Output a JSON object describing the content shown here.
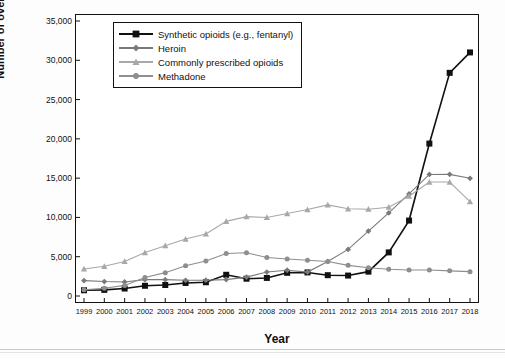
{
  "chart_data": {
    "type": "line",
    "title": "",
    "xlabel": "Year",
    "ylabel": "Number of overdose deaths",
    "categories": [
      1999,
      2000,
      2001,
      2002,
      2003,
      2004,
      2005,
      2006,
      2007,
      2008,
      2009,
      2010,
      2011,
      2012,
      2013,
      2014,
      2015,
      2016,
      2017,
      2018
    ],
    "xlim": [
      1999,
      2018
    ],
    "ylim": [
      0,
      35000
    ],
    "yticks": [
      0,
      5000,
      10000,
      15000,
      20000,
      25000,
      30000,
      35000
    ],
    "ytick_labels": [
      "0",
      "5,000",
      "10,000",
      "15,000",
      "20,000",
      "25,000",
      "30,000",
      "35,000"
    ],
    "xtick_labels": [
      "1999",
      "2000",
      "2001",
      "2002",
      "2003",
      "2004",
      "2005",
      "2006",
      "2007",
      "2008",
      "2009",
      "2010",
      "2011",
      "2012",
      "2013",
      "2014",
      "2015",
      "2016",
      "2017",
      "2018"
    ],
    "grid": false,
    "legend_position": "top-left",
    "series": [
      {
        "name": "Synthetic opioids (e.g., fentanyl)",
        "color": "#111111",
        "marker": "square",
        "values": [
          730,
          780,
          950,
          1300,
          1400,
          1660,
          1750,
          2700,
          2200,
          2300,
          2950,
          3000,
          2650,
          2600,
          3100,
          5550,
          9600,
          19400,
          28400,
          31000
        ]
      },
      {
        "name": "Heroin",
        "color": "#7a7a7a",
        "marker": "diamond",
        "values": [
          1960,
          1840,
          1780,
          2080,
          2080,
          2000,
          2010,
          2090,
          2400,
          3050,
          3280,
          3040,
          4400,
          5930,
          8260,
          10570,
          12990,
          15470,
          15480,
          14980
        ]
      },
      {
        "name": "Commonly prescribed opioids",
        "color": "#a8a8a8",
        "marker": "triangle",
        "values": [
          3440,
          3780,
          4400,
          5530,
          6400,
          7250,
          7900,
          9500,
          10100,
          10000,
          10500,
          11000,
          11600,
          11100,
          11050,
          11300,
          12700,
          14500,
          14500,
          12000
        ]
      },
      {
        "name": "Methadone",
        "color": "#8e8e8e",
        "marker": "circle",
        "values": [
          780,
          980,
          1350,
          2360,
          2970,
          3850,
          4460,
          5400,
          5500,
          4900,
          4700,
          4550,
          4400,
          3900,
          3600,
          3400,
          3300,
          3300,
          3200,
          3100
        ]
      }
    ]
  },
  "legend": {
    "items": [
      {
        "label": "Synthetic opioids (e.g., fentanyl)"
      },
      {
        "label": "Heroin"
      },
      {
        "label": "Commonly prescribed opioids"
      },
      {
        "label": "Methadone"
      }
    ]
  }
}
